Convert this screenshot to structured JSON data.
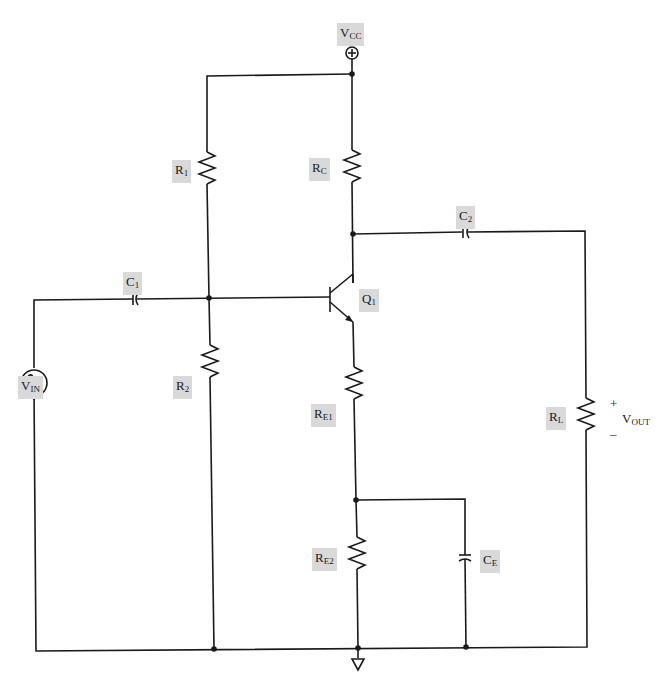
{
  "diagram": {
    "supply": {
      "name": "V",
      "sub": "CC",
      "symbol": "⊕"
    },
    "source": {
      "name": "V",
      "sub": "IN",
      "symbol": "∿"
    },
    "transistor": {
      "name": "Q",
      "sub": "1",
      "type": "NPN"
    },
    "resistors": [
      {
        "id": "R1",
        "name": "R",
        "sub": "1"
      },
      {
        "id": "R2",
        "name": "R",
        "sub": "2"
      },
      {
        "id": "RC",
        "name": "R",
        "sub": "C"
      },
      {
        "id": "RE1",
        "name": "R",
        "sub": "E1"
      },
      {
        "id": "RE2",
        "name": "R",
        "sub": "E2"
      },
      {
        "id": "RL",
        "name": "R",
        "sub": "L"
      }
    ],
    "capacitors": [
      {
        "id": "C1",
        "name": "C",
        "sub": "1"
      },
      {
        "id": "C2",
        "name": "C",
        "sub": "2"
      },
      {
        "id": "CE",
        "name": "C",
        "sub": "E"
      }
    ],
    "output": {
      "name": "V",
      "sub": "OUT",
      "plus": "+",
      "minus": "–"
    },
    "ground": {
      "symbol": "ground"
    },
    "colors": {
      "wire": "#1a1a1a",
      "label_bg": "#d9d9d9",
      "background": "#ffffff"
    }
  }
}
